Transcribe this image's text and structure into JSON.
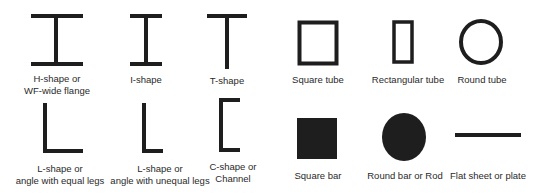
{
  "colors": {
    "stroke": "#1e1e1e",
    "text": "#2a2a2a",
    "background": "#ffffff"
  },
  "shapes": [
    {
      "id": "h-shape",
      "label_lines": [
        "H-shape or",
        "WF-wide flange"
      ]
    },
    {
      "id": "i-shape",
      "label_lines": [
        "I-shape"
      ]
    },
    {
      "id": "t-shape",
      "label_lines": [
        "T-shape"
      ]
    },
    {
      "id": "square-tube",
      "label_lines": [
        "Square tube"
      ]
    },
    {
      "id": "rectangular-tube",
      "label_lines": [
        "Rectangular tube"
      ]
    },
    {
      "id": "round-tube",
      "label_lines": [
        "Round tube"
      ]
    },
    {
      "id": "l-shape-equal",
      "label_lines": [
        "L-shape or",
        "angle with equal legs"
      ]
    },
    {
      "id": "l-shape-unequal",
      "label_lines": [
        "L-shape or",
        "angle with unequal legs"
      ]
    },
    {
      "id": "c-shape",
      "label_lines": [
        "C-shape or",
        "Channel"
      ]
    },
    {
      "id": "square-bar",
      "label_lines": [
        "Square bar"
      ]
    },
    {
      "id": "round-bar",
      "label_lines": [
        "Round bar or Rod"
      ]
    },
    {
      "id": "flat-plate",
      "label_lines": [
        "Flat sheet or plate"
      ]
    }
  ]
}
